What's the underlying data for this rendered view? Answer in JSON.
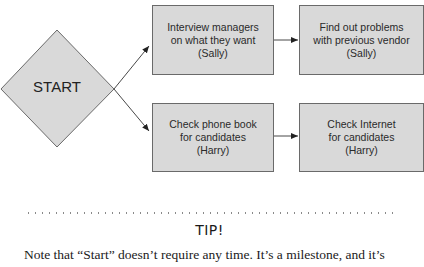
{
  "diagram": {
    "start": {
      "label": "START"
    },
    "boxes": [
      {
        "id": "interview",
        "label": "Interview managers\non what they want\n(Sally)"
      },
      {
        "id": "problems",
        "label": "Find out problems\nwith previous vendor\n(Sally)"
      },
      {
        "id": "phonebook",
        "label": "Check phone book\nfor candidates\n(Harry)"
      },
      {
        "id": "internet",
        "label": "Check Internet\nfor candidates\n(Harry)"
      }
    ],
    "colors": {
      "box_fill": "#d9d9d9",
      "box_border": "#6a6a6a",
      "arrow": "#333333"
    }
  },
  "tip": {
    "heading": "TIP!",
    "body": "Note that “Start” doesn’t require any time. It’s a milestone, and it’s"
  }
}
